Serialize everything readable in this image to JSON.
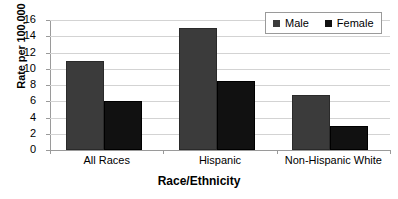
{
  "chart_data": {
    "type": "bar",
    "title": "",
    "xlabel": "Race/Ethnicity",
    "ylabel": "Rate per 100,000",
    "categories": [
      "All Races",
      "Hispanic",
      "Non-Hispanic White"
    ],
    "series": [
      {
        "name": "Male",
        "color": "#3b3b3b",
        "values": [
          11,
          15,
          6.8
        ]
      },
      {
        "name": "Female",
        "color": "#111111",
        "values": [
          6,
          8.5,
          3
        ]
      }
    ],
    "ylim": [
      0,
      16
    ],
    "ytick_step": 2,
    "yticks": [
      0,
      2,
      4,
      6,
      8,
      10,
      12,
      14,
      16
    ],
    "ytick_labels": [
      "0",
      "2",
      "4",
      "6",
      "8",
      "10",
      "12",
      "14",
      "16"
    ],
    "grid": true,
    "legend_position": "top-right"
  },
  "legend": {
    "entries": [
      {
        "label": "Male",
        "swatch": "male-swatch"
      },
      {
        "label": "Female",
        "swatch": "female-swatch"
      }
    ]
  }
}
